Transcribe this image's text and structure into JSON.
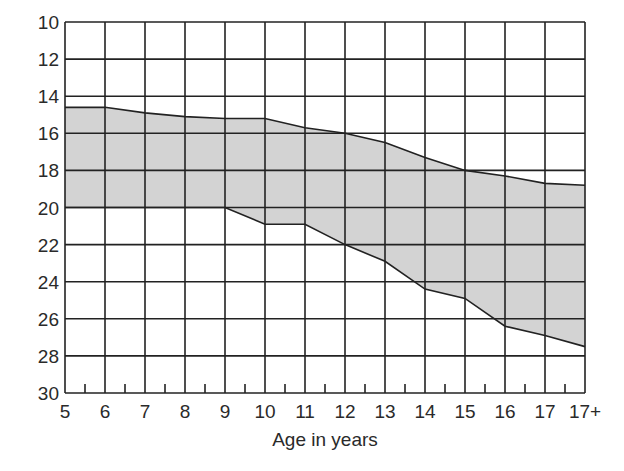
{
  "chart_data": {
    "type": "area",
    "title": "",
    "xlabel": "Age in years",
    "ylabel": "",
    "x_categories": [
      "5",
      "6",
      "7",
      "8",
      "9",
      "10",
      "11",
      "12",
      "13",
      "14",
      "15",
      "16",
      "17",
      "17+"
    ],
    "yticks": [
      10,
      12,
      14,
      16,
      18,
      20,
      22,
      24,
      26,
      28,
      30
    ],
    "ylim": [
      10,
      30
    ],
    "y_inverted": true,
    "grid": true,
    "minor_x_ticks": true,
    "series": [
      {
        "name": "lower bound (upper edge of band)",
        "values": [
          14.6,
          14.6,
          14.9,
          15.1,
          15.2,
          15.2,
          15.7,
          16.0,
          16.5,
          17.3,
          18.0,
          18.3,
          18.7,
          18.8
        ]
      },
      {
        "name": "upper bound (lower edge of band)",
        "values": [
          20.0,
          20.0,
          20.0,
          20.0,
          20.0,
          20.9,
          20.9,
          22.0,
          22.9,
          24.4,
          24.9,
          26.4,
          26.9,
          27.5
        ]
      }
    ],
    "band_fill_color": "#d3d3d3",
    "line_color": "#222222",
    "legend": null
  },
  "axis": {
    "x_label": "Age in years"
  }
}
